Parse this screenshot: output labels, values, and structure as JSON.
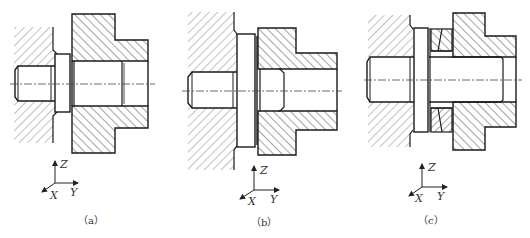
{
  "figure": {
    "type": "mechanical-cross-section",
    "panel_count": 3,
    "colors": {
      "line": "#1a1a1a",
      "hatch": "#555555",
      "centerline": "#444444",
      "background": "#ffffff"
    },
    "panels": [
      {
        "id": "a",
        "caption": "（a）",
        "axes": {
          "x": "X",
          "y": "Y",
          "z": "Z"
        },
        "parts": [
          "fixed-wall",
          "stepped-pin",
          "flange-collar",
          "flanged-bushing"
        ]
      },
      {
        "id": "b",
        "caption": "（b）",
        "axes": {
          "x": "X",
          "y": "Y",
          "z": "Z"
        },
        "parts": [
          "fixed-wall",
          "stepped-pin",
          "large-flange-collar",
          "flanged-bushing"
        ]
      },
      {
        "id": "c",
        "caption": "（c）",
        "axes": {
          "x": "X",
          "y": "Y",
          "z": "Z"
        },
        "parts": [
          "fixed-wall",
          "through-pin",
          "flange-collar",
          "conical-ring",
          "flanged-bushing"
        ]
      }
    ]
  }
}
